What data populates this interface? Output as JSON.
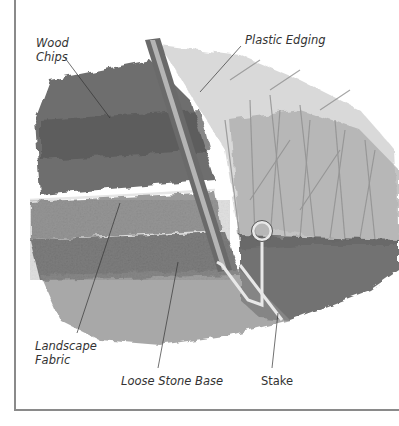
{
  "figure": {
    "labels": {
      "wood_chips": "Wood\nChips",
      "plastic_edging": "Plastic Edging",
      "landscape_fabric": "Landscape\nFabric",
      "loose_stone_base": "Loose Stone Base",
      "stake": "Stake"
    },
    "colors": {
      "frame": "#8a8a8a",
      "text": "#333333",
      "soil_dark": "#4a4a4a",
      "grass": "#b8b8b8"
    }
  }
}
